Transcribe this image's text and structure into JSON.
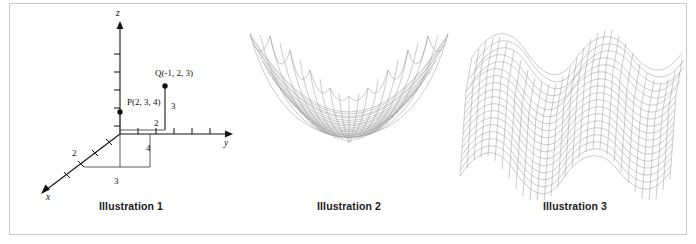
{
  "figure": {
    "border_color": "#c9c9c9",
    "background": "#ffffff",
    "panel_count": 3
  },
  "panels": [
    {
      "id": "illustration-1",
      "caption": "Illustration 1",
      "type": "3d-coordinate-axes-diagram",
      "axes": [
        {
          "name": "z",
          "label": "z",
          "direction": "up",
          "tick_count": 5
        },
        {
          "name": "y",
          "label": "y",
          "direction": "right",
          "tick_count": 5
        },
        {
          "name": "x",
          "label": "x",
          "direction": "down-left",
          "tick_count": 4
        }
      ],
      "points": [
        {
          "name": "P",
          "label": "P(2, 3, 4)",
          "x": 2,
          "y": 3,
          "z": 4
        },
        {
          "name": "Q",
          "label": "Q(-1, 2, 3)",
          "x": -1,
          "y": 2,
          "z": 3
        }
      ],
      "segment_labels": [
        "2",
        "3",
        "2",
        "3",
        "4"
      ]
    },
    {
      "id": "illustration-2",
      "caption": "Illustration 2",
      "type": "wireframe-surface",
      "surface": "elliptic-paraboloid-bowl",
      "mesh_color": "#8d8d8d"
    },
    {
      "id": "illustration-3",
      "caption": "Illustration 3",
      "type": "wireframe-surface",
      "surface": "rippled-wave-sheet",
      "mesh_color": "#8d8d8d"
    }
  ]
}
